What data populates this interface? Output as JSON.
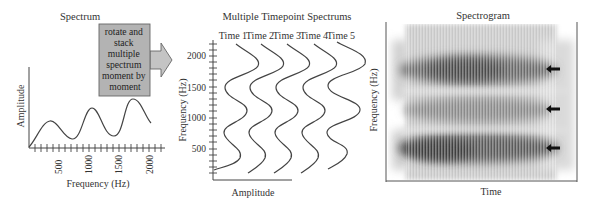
{
  "panels": {
    "spectrum": {
      "title": "Spectrum",
      "xlabel": "Frequency (Hz)",
      "ylabel": "Amplitude",
      "xticks": [
        "500",
        "1000",
        "1500",
        "2000"
      ]
    },
    "transform_box": {
      "lines": [
        "rotate and",
        "stack",
        "multiple",
        "spectrum",
        "moment by",
        "moment"
      ],
      "fill": "#b3b3b3"
    },
    "timepoints": {
      "title": "Multiple Timepoint Spectrums",
      "time_labels": [
        "Time 1",
        "Time 2",
        "Time 3",
        "Time 4",
        "Time 5"
      ],
      "ylabel": "Frequency (Hz)",
      "xlabel": "Amplitude",
      "yticks": [
        "2000",
        "1500",
        "1000",
        "500"
      ]
    },
    "spectrogram": {
      "title": "Spectrogram",
      "ylabel": "Frequency (Hz)",
      "xlabel": "Time",
      "formant_arrows": 3
    }
  }
}
